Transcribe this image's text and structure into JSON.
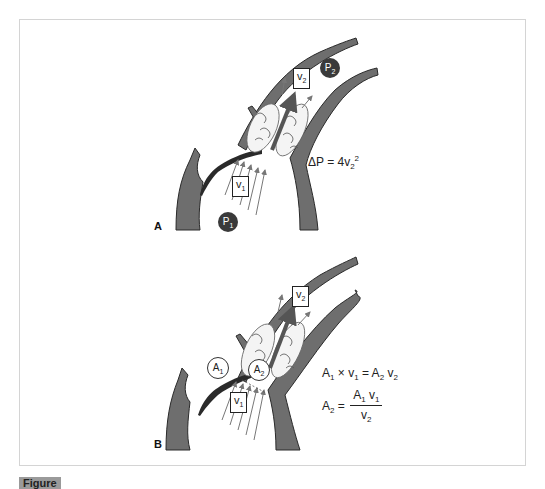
{
  "figure": {
    "panels": [
      {
        "label": "A",
        "velocity_labels": {
          "v1": "v",
          "v1_sub": "1",
          "v2": "v",
          "v2_sub": "2"
        },
        "pressure_labels": {
          "p1": "P",
          "p1_sub": "1",
          "p2": "P",
          "p2_sub": "2"
        },
        "equation": {
          "lhs": "ΔP = 4v",
          "sub": "2",
          "sup": "2"
        }
      },
      {
        "label": "B",
        "velocity_labels": {
          "v1": "v",
          "v1_sub": "1",
          "v2": "v",
          "v2_sub": "2"
        },
        "area_labels": {
          "a1": "A",
          "a1_sub": "1",
          "a2": "A",
          "a2_sub": "2"
        },
        "equation_continuity": {
          "a1": "A",
          "a1_sub": "1",
          "times": " × v",
          "v1_sub": "1",
          "eq": " = A",
          "a2_sub": "2",
          "v2": " v",
          "v2_sub": "2"
        },
        "equation_solved": {
          "lhs": "A",
          "lhs_sub": "2",
          "eq": " =",
          "num_a": "A",
          "num_a_sub": "1",
          "num_v": " v",
          "num_v_sub": "1",
          "den_v": "v",
          "den_v_sub": "2"
        }
      }
    ],
    "colors": {
      "vessel_wall": "#6e6e6e",
      "vessel_outline": "#2a2a2a",
      "pressure_circle": "#3a3a3a",
      "flow_arrow": "#777777",
      "frame_border": "#d4d4d4"
    },
    "caption": {
      "label": "Figure",
      "text": "(caption text cut off at image bottom)"
    }
  }
}
